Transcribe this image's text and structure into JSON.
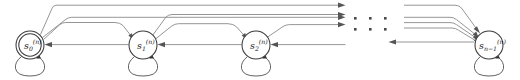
{
  "diagram": {
    "type": "finite-state-machine",
    "background_color": "#ffffff",
    "edge_color": "#8a8a8a",
    "node_stroke_color": "#3a3a3a",
    "label_color": "#1a1a1a",
    "ellipsis": {
      "name": "states-continuation-ellipsis",
      "dot_rows": 2,
      "dot_columns": 3,
      "dot_color": "#4a4a4a"
    },
    "states": [
      {
        "id": "s0",
        "base": "s",
        "subscript": "0",
        "superscript": "(n)",
        "accepting": true,
        "double_circle": true,
        "has_self_loop": true,
        "cx": 30,
        "cy": 45,
        "r": 14
      },
      {
        "id": "s1",
        "base": "s",
        "subscript": "1",
        "superscript": "(n)",
        "accepting": false,
        "double_circle": false,
        "has_self_loop": true,
        "cx": 143,
        "cy": 45,
        "r": 14
      },
      {
        "id": "s2",
        "base": "s",
        "subscript": "2",
        "superscript": "(n)",
        "accepting": false,
        "double_circle": false,
        "has_self_loop": true,
        "cx": 256,
        "cy": 45,
        "r": 14
      },
      {
        "id": "sn1",
        "base": "s",
        "subscript": "n−1",
        "superscript": "(n)",
        "accepting": false,
        "double_circle": false,
        "has_self_loop": true,
        "cx": 489,
        "cy": 45,
        "r": 14
      }
    ],
    "transitions": {
      "forward_description": "fan of rightward arcs from each state to all later states",
      "backward_description": "leftward arrows from each state to its predecessor",
      "self_loop_description": "each state has a self-loop below it"
    }
  }
}
